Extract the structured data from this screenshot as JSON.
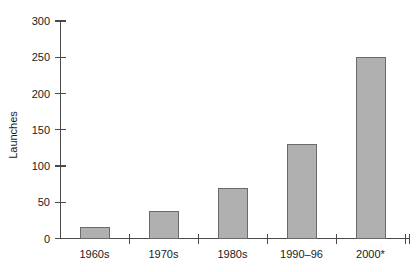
{
  "chart_data": {
    "type": "bar",
    "title": "",
    "xlabel": "",
    "ylabel": "Launches",
    "categories": [
      "1960s",
      "1970s",
      "1980s",
      "1990–96",
      "2000*"
    ],
    "values": [
      15,
      37,
      69,
      130,
      250
    ],
    "ylim": [
      0,
      300
    ],
    "yticks": [
      0,
      50,
      100,
      150,
      200,
      250,
      300
    ],
    "ytick_labels": [
      "0",
      "50",
      "100",
      "150",
      "200",
      "250",
      "300"
    ],
    "grid": false,
    "legend": false,
    "legend_position": "none",
    "series": [
      {
        "name": "Launches",
        "values": [
          15,
          37,
          69,
          130,
          250
        ]
      }
    ],
    "colors": {
      "bar_fill": "#b0b0b0",
      "bar_stroke": "#6a6a6a",
      "axis": "#4a4a4a",
      "text": "#1a1a1a",
      "background": "#ffffff"
    }
  },
  "axes": {
    "y_axis_name": "y-axis",
    "x_axis_name": "x-axis"
  }
}
